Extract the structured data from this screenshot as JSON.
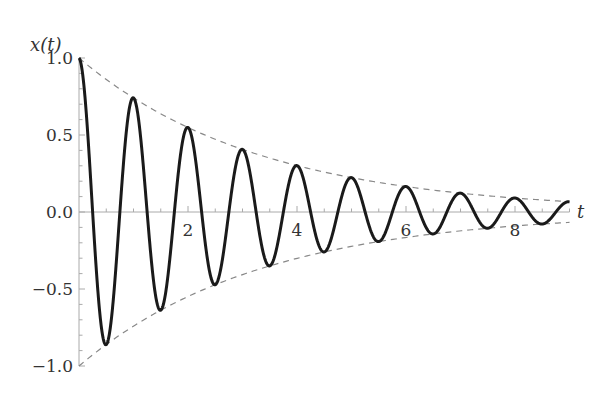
{
  "chart_data": {
    "type": "line",
    "title": "",
    "xlabel": "t",
    "ylabel": "x(t)",
    "xlim": [
      0,
      9
    ],
    "ylim": [
      -1.0,
      1.0
    ],
    "grid": false,
    "legend": null,
    "x_ticks": [
      2,
      4,
      6,
      8
    ],
    "x_tick_labels": [
      "2",
      "4",
      "6",
      "8"
    ],
    "x_minor_step": 0.5,
    "y_ticks": [
      1.0,
      0.5,
      0.0,
      -0.5,
      -1.0
    ],
    "y_tick_labels": [
      "1.0",
      "0.5",
      "0.0",
      "−0.5",
      "−1.0"
    ],
    "y_minor_step": 0.1,
    "series": [
      {
        "name": "x(t)",
        "style": "solid",
        "color": "#1a1a1a",
        "function": "exp(-0.3 t) cos(2 pi t)",
        "peaks": [
          {
            "t": 0,
            "x": 1.0
          },
          {
            "t": 1,
            "x": 0.74
          },
          {
            "t": 2,
            "x": 0.55
          },
          {
            "t": 3,
            "x": 0.41
          },
          {
            "t": 4,
            "x": 0.3
          },
          {
            "t": 5,
            "x": 0.22
          },
          {
            "t": 6,
            "x": 0.17
          },
          {
            "t": 7,
            "x": 0.12
          },
          {
            "t": 8,
            "x": 0.09
          }
        ],
        "troughs": [
          {
            "t": 0.5,
            "x": -0.86
          },
          {
            "t": 1.5,
            "x": -0.64
          },
          {
            "t": 2.5,
            "x": -0.47
          },
          {
            "t": 3.5,
            "x": -0.35
          },
          {
            "t": 4.5,
            "x": -0.26
          },
          {
            "t": 5.5,
            "x": -0.19
          },
          {
            "t": 6.5,
            "x": -0.14
          },
          {
            "t": 7.5,
            "x": -0.11
          },
          {
            "t": 8.5,
            "x": -0.08
          }
        ]
      },
      {
        "name": "upper envelope",
        "style": "dashed",
        "color": "#888888",
        "function": "exp(-0.3 t)"
      },
      {
        "name": "lower envelope",
        "style": "dashed",
        "color": "#888888",
        "function": "-exp(-0.3 t)"
      }
    ],
    "params": {
      "decay": 0.3,
      "omega": 6.2832,
      "t_end": 9
    }
  },
  "labels": {
    "ylabel": "x(t)",
    "xlabel": "t"
  },
  "colors": {
    "curve": "#1a1a1a",
    "envelope": "#888888",
    "axis": "#aaaaaa",
    "text": "#333333"
  }
}
